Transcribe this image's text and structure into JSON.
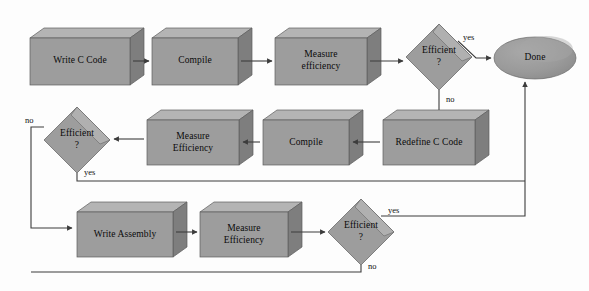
{
  "diagram": {
    "canvas": {
      "width": 589,
      "height": 291
    },
    "colors": {
      "background": "#fdfdfd",
      "face": "#9d9d9d",
      "top": "#b4b4b4",
      "side": "#7f7f7f",
      "outline": "#5d5d5d",
      "line": "#3c3c3c",
      "text": "#0a0a0a"
    }
  },
  "nodes": {
    "write_c_code": {
      "label": "Write C Code",
      "shape": "box3d"
    },
    "compile_top": {
      "label": "Compile",
      "shape": "box3d"
    },
    "measure_efficiency_top": {
      "label": "Measure\nefficiency",
      "shape": "box3d"
    },
    "efficient_top": {
      "label": "Efficient\n?",
      "shape": "diamond3d"
    },
    "done": {
      "label": "Done",
      "shape": "ellipse3d"
    },
    "redefine_c_code": {
      "label": "Redefine C Code",
      "shape": "box3d"
    },
    "compile_mid": {
      "label": "Compile",
      "shape": "box3d"
    },
    "measure_efficiency_mid": {
      "label": "Measure\nEfficiency",
      "shape": "box3d"
    },
    "efficient_mid": {
      "label": "Efficient\n?",
      "shape": "diamond3d"
    },
    "write_assembly": {
      "label": "Write Assembly",
      "shape": "box3d"
    },
    "measure_efficiency_bottom": {
      "label": "Measure\nEfficiency",
      "shape": "box3d"
    },
    "efficient_bottom": {
      "label": "Efficient\n?",
      "shape": "diamond3d"
    }
  },
  "edge_labels": {
    "top_yes": "yes",
    "top_no": "no",
    "mid_no": "no",
    "mid_yes": "yes",
    "bottom_yes": "yes",
    "bottom_no": "no"
  }
}
